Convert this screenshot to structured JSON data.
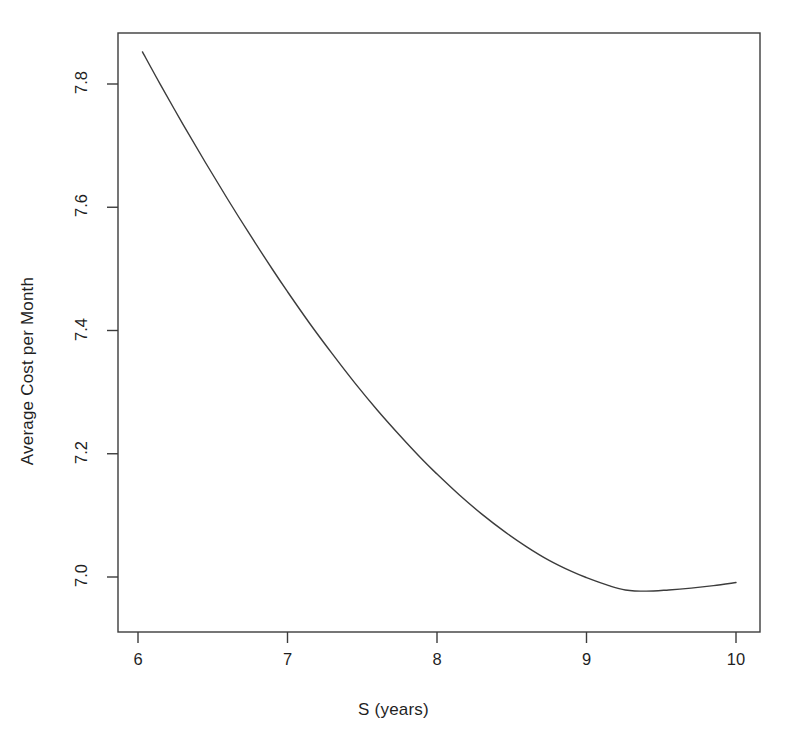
{
  "chart_data": {
    "type": "line",
    "title": "",
    "subtitle": "",
    "xlabel": "S (years)",
    "ylabel": "Average Cost per Month",
    "xlim": [
      5.9,
      10.1
    ],
    "ylim": [
      6.92,
      7.88
    ],
    "xticks": [
      6,
      7,
      8,
      9,
      10
    ],
    "xtick_labels": [
      "6",
      "7",
      "8",
      "9",
      "10"
    ],
    "yticks": [
      7.0,
      7.2,
      7.4,
      7.6,
      7.8
    ],
    "ytick_labels": [
      "7.0",
      "7.2",
      "7.4",
      "7.6",
      "7.8"
    ],
    "grid": false,
    "legend": null,
    "annotations": [],
    "series": [
      {
        "name": "Average cost per month",
        "color": "#3c3c3c",
        "line_width": 1.4,
        "x": [
          6.03,
          6.15,
          6.3,
          6.45,
          6.6,
          6.75,
          6.9,
          7.0,
          7.15,
          7.3,
          7.45,
          7.6,
          7.75,
          7.9,
          8.0,
          8.15,
          8.3,
          8.45,
          8.6,
          8.75,
          8.9,
          9.0,
          9.15,
          9.26,
          9.4,
          9.55,
          9.7,
          9.85,
          10.0
        ],
        "y": [
          7.852,
          7.799,
          7.735,
          7.673,
          7.613,
          7.555,
          7.499,
          7.463,
          7.411,
          7.362,
          7.315,
          7.271,
          7.23,
          7.191,
          7.167,
          7.133,
          7.102,
          7.074,
          7.049,
          7.027,
          7.009,
          6.999,
          6.986,
          6.979,
          6.977,
          6.979,
          6.982,
          6.986,
          6.991
        ]
      }
    ]
  },
  "axes": {
    "frame_color": "#3c3c3c",
    "background": "#ffffff"
  }
}
